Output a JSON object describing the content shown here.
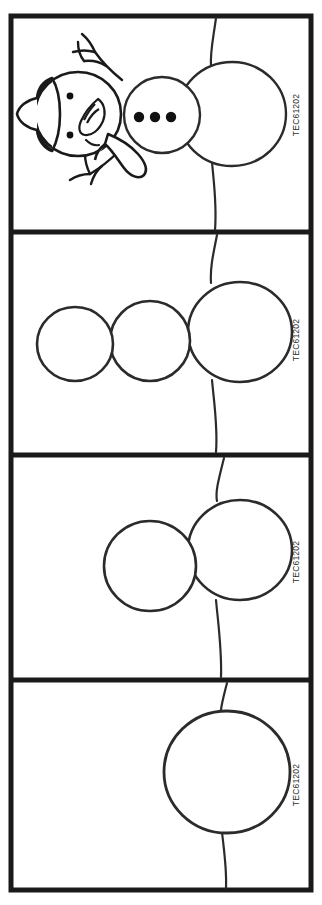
{
  "worksheet": {
    "title_fragment": "Draw a snowman",
    "background_color": "#ffffff",
    "ink_color": "#1a1a1a",
    "frame_stroke_color": "#1a1a1a",
    "outline_stroke_color": "#2b2b2b",
    "width": 322,
    "height": 905
  },
  "panels": [
    {
      "index": 1,
      "name": "panel-complete-snowman",
      "code": "TEC61202",
      "circle_count": 3,
      "has_snowman_details": true,
      "details": [
        "hat",
        "carrot-nose",
        "coal-eyes",
        "smile",
        "scarf",
        "twig-arms",
        "coal-buttons"
      ],
      "button_count": 3,
      "eye_count": 2,
      "arm_count": 2
    },
    {
      "index": 2,
      "name": "panel-three-circles",
      "code": "TEC61202",
      "circle_count": 3,
      "has_snowman_details": false,
      "details": [],
      "button_count": 0,
      "eye_count": 0,
      "arm_count": 0
    },
    {
      "index": 3,
      "name": "panel-two-circles",
      "code": "TEC61202",
      "circle_count": 2,
      "has_snowman_details": false,
      "details": [],
      "button_count": 0,
      "eye_count": 0,
      "arm_count": 0
    },
    {
      "index": 4,
      "name": "panel-one-circle",
      "code": "TEC61202",
      "circle_count": 1,
      "has_snowman_details": false,
      "details": [],
      "button_count": 0,
      "eye_count": 0,
      "arm_count": 0
    }
  ]
}
